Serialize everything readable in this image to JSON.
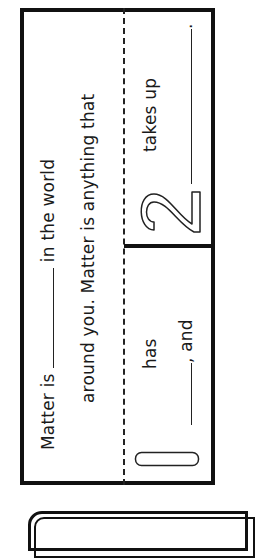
{
  "worksheet": {
    "top": {
      "line1_pre": "Matter is",
      "line1_post": "in the world",
      "line2": "around you. Matter is anything that"
    },
    "cell1": {
      "number": "1",
      "word": "has",
      "blank_post": ", and"
    },
    "cell2": {
      "number": "2",
      "word": "takes up",
      "blank_post": "."
    }
  },
  "colors": {
    "ink": "#111111",
    "paper": "#ffffff"
  }
}
